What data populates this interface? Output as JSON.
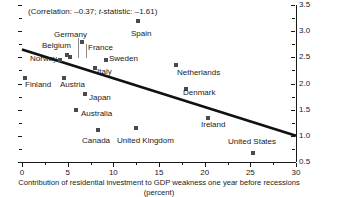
{
  "chart_data": {
    "type": "scatter",
    "title": "",
    "annotation": "(Correlation: –0.37; t-statistic: –1.61)",
    "annotation_prefix": "(Correlation: –0.37; ",
    "annotation_italic": "t",
    "annotation_suffix": "-statistic: –1.61)",
    "xlabel": "Contribution of residential investment to GDP weakness one year before recessions (percent)",
    "ylabel": "Employment rigidity index",
    "ylabel_superscript": "2",
    "xlim": [
      0,
      30
    ],
    "ylim": [
      0.5,
      3.5
    ],
    "xticks": [
      0,
      5,
      10,
      15,
      20,
      25,
      30
    ],
    "xtick_labels": [
      "0",
      "5",
      "10",
      "15",
      "20",
      "25",
      "30"
    ],
    "yticks": [
      0.5,
      1.0,
      1.5,
      2.0,
      2.5,
      3.0,
      3.5
    ],
    "ytick_labels": [
      "0.5",
      "1.0",
      "1.5",
      "2.0",
      "2.5",
      "3.0",
      "3.5"
    ],
    "y_minor_ticks": [
      0.75,
      1.25,
      1.75,
      2.25,
      2.75,
      3.25
    ],
    "x_minor_ticks": [
      2.5,
      7.5,
      12.5,
      17.5,
      22.5,
      27.5
    ],
    "grid": false,
    "legend": "none",
    "marker_color": "#4a4a4a",
    "trendline_color": "#111111",
    "trendline": {
      "x0": 0,
      "y0": 2.65,
      "x1": 30,
      "y1": 1.0
    },
    "points": [
      {
        "name": "Germany",
        "x": 5.3,
        "y": 2.5,
        "label_x": 54,
        "label_y": 30,
        "leader": {
          "x": 78,
          "y1": 38,
          "y2": 58
        }
      },
      {
        "name": "Belgium",
        "x": 4.9,
        "y": 2.55,
        "label_x": 42,
        "label_y": 41,
        "leader": {
          "x": 86,
          "y1": 44,
          "y2": 58
        }
      },
      {
        "name": "France",
        "x": 6.6,
        "y": 2.8,
        "label_x": 88,
        "label_y": 43,
        "leader": null
      },
      {
        "name": "Spain",
        "x": 12.7,
        "y": 3.2,
        "label_x": 131,
        "label_y": 29,
        "leader": null
      },
      {
        "name": "Norway",
        "x": 4.2,
        "y": 2.45,
        "label_x": 30,
        "label_y": 54,
        "leader": null
      },
      {
        "name": "Sweden",
        "x": 9.2,
        "y": 2.45,
        "label_x": 109,
        "label_y": 54,
        "leader": null
      },
      {
        "name": "Italy",
        "x": 8.0,
        "y": 2.3,
        "label_x": 97,
        "label_y": 67,
        "leader": null
      },
      {
        "name": "Netherlands",
        "x": 16.9,
        "y": 2.35,
        "label_x": 177,
        "label_y": 68,
        "leader": null
      },
      {
        "name": "Finland",
        "x": 0.3,
        "y": 2.1,
        "label_x": 25,
        "label_y": 80,
        "leader": null
      },
      {
        "name": "Austria",
        "x": 4.6,
        "y": 2.1,
        "label_x": 60,
        "label_y": 80,
        "leader": null
      },
      {
        "name": "Denmark",
        "x": 18.0,
        "y": 1.9,
        "label_x": 183,
        "label_y": 88,
        "leader": null
      },
      {
        "name": "Japan",
        "x": 6.9,
        "y": 1.8,
        "label_x": 89,
        "label_y": 93,
        "leader": null
      },
      {
        "name": "Australia",
        "x": 5.9,
        "y": 1.5,
        "label_x": 81,
        "label_y": 109,
        "leader": null
      },
      {
        "name": "Ireland",
        "x": 20.4,
        "y": 1.35,
        "label_x": 201,
        "label_y": 120,
        "leader": null
      },
      {
        "name": "Canada",
        "x": 8.3,
        "y": 1.12,
        "label_x": 82,
        "label_y": 136,
        "leader": null
      },
      {
        "name": "United Kingdom",
        "x": 12.5,
        "y": 1.15,
        "label_x": 117,
        "label_y": 136,
        "leader": null
      },
      {
        "name": "United States",
        "x": 25.3,
        "y": 0.67,
        "label_x": 228,
        "label_y": 137,
        "leader": null
      }
    ]
  }
}
